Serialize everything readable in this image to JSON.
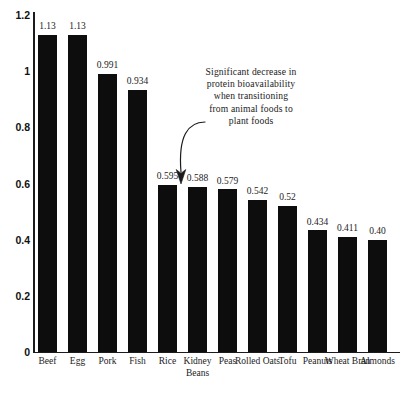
{
  "chart_data": {
    "type": "bar",
    "title": "",
    "subtitle": "",
    "xlabel": "",
    "ylabel": "",
    "ylim": [
      0,
      1.2
    ],
    "yticks": [
      "0",
      "0.2",
      "0.4",
      "0.6",
      "0.8",
      "1",
      "1.2"
    ],
    "ytick_values": [
      0,
      0.2,
      0.4,
      0.6,
      0.8,
      1,
      1.2
    ],
    "grid": false,
    "legend": false,
    "bar_color": "#0d0d0d",
    "axis_color": "#1b1b1b",
    "background_color": "#ffffff",
    "categories": [
      "Beef",
      "Egg",
      "Pork",
      "Fish",
      "Rice",
      "Kidney Beans",
      "Peas",
      "Rolled Oats",
      "Tofu",
      "Peanuts",
      "Wheat Bran",
      "Almonds"
    ],
    "values": [
      1.13,
      1.13,
      0.991,
      0.934,
      0.595,
      0.588,
      0.579,
      0.542,
      0.52,
      0.434,
      0.411,
      0.4
    ],
    "value_labels": [
      "1.13",
      "1.13",
      "0.991",
      "0.934",
      "0.595",
      "0.588",
      "0.579",
      "0.542",
      "0.52",
      "0.434",
      "0.411",
      "0.40"
    ],
    "annotations": [
      {
        "name": "bioavailability-decrease-note",
        "lines": [
          "Significant decrease in",
          "protein bioavailability",
          "when transitioning",
          "from animal foods to",
          "plant foods"
        ],
        "text": "Significant decrease in protein bioavailability when transitioning from animal foods to plant foods",
        "points_to_category": "Rice"
      }
    ]
  }
}
